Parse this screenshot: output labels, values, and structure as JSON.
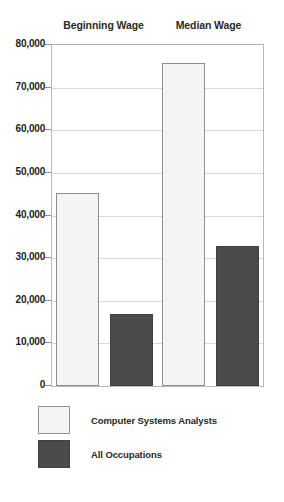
{
  "chart_data": {
    "type": "bar",
    "title": "",
    "xlabel": "",
    "ylabel": "",
    "ylim": [
      0,
      80000
    ],
    "grid": true,
    "legend_position": "bottom-left",
    "categories": [
      "Beginning Wage",
      "Median Wage"
    ],
    "ytick_labels": [
      "0",
      "10,000",
      "20,000",
      "30,000",
      "40,000",
      "50,000",
      "60,000",
      "70,000",
      "80,000"
    ],
    "ytick_values": [
      0,
      10000,
      20000,
      30000,
      40000,
      50000,
      60000,
      70000,
      80000
    ],
    "series": [
      {
        "name": "Computer Systems Analysts",
        "color": "#f4f4f4",
        "border_color": "#8e8e8e",
        "values": [
          45200,
          75800
        ]
      },
      {
        "name": "All Occupations",
        "color": "#4b4b4b",
        "border_color": "#3f3f3f",
        "values": [
          16800,
          32800
        ]
      }
    ]
  },
  "legend": {
    "items": [
      {
        "label": "Computer Systems Analysts",
        "swatch": "light"
      },
      {
        "label": "All Occupations",
        "swatch": "dark"
      }
    ]
  },
  "colors": {
    "light_bar": "#f4f4f4",
    "dark_bar": "#4b4b4b",
    "gridline": "#d8d8d8",
    "axis": "#b9b9b9",
    "text": "#1d1d1d"
  }
}
